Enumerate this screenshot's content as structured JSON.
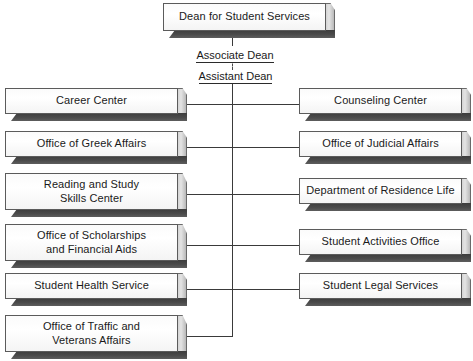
{
  "chart": {
    "type": "org-chart",
    "root": {
      "label": "Dean for Student Services"
    },
    "intermediate_roles": [
      {
        "label": "Associate Dean"
      },
      {
        "label": "Assistant Dean"
      }
    ],
    "left_column": [
      {
        "label": "Career Center"
      },
      {
        "label": "Office of Greek Affairs"
      },
      {
        "label": "Reading and Study\nSkills Center"
      },
      {
        "label": "Office of Scholarships\nand Financial Aids"
      },
      {
        "label": "Student Health Service"
      },
      {
        "label": "Office of Traffic and\nVeterans Affairs"
      }
    ],
    "right_column": [
      {
        "label": "Counseling Center"
      },
      {
        "label": "Office of Judicial Affairs"
      },
      {
        "label": "Department of Residence Life"
      },
      {
        "label": "Student Activities Office"
      },
      {
        "label": "Student Legal Services"
      }
    ],
    "colors": {
      "background": "#ffffff",
      "box_face": "#ffffff",
      "box_border": "#5b5b5b",
      "box_side": "#d4d4d4",
      "box_shadow": "#4a4a4a",
      "connector": "#3a3a3a",
      "text": "#1a1a1a"
    }
  }
}
